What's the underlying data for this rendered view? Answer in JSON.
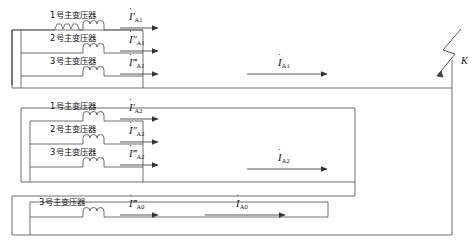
{
  "diagram": {
    "type": "single-line-electrical-network",
    "fault_marker": {
      "label": "K",
      "symbol": "lightning-fault-icon"
    },
    "groups": [
      {
        "id": "group-1",
        "total_current": "I_A1",
        "total_current_base": "I",
        "total_current_sub": "A1",
        "total_current_primes": "",
        "branches": [
          {
            "name": "1号主变压器",
            "current_base": "I",
            "current_primes": "′",
            "current_sub": "A1"
          },
          {
            "name": "2号主变压器",
            "current_base": "I",
            "current_primes": "″",
            "current_sub": "A1"
          },
          {
            "name": "3号主变压器",
            "current_base": "I",
            "current_primes": "‴",
            "current_sub": "A1"
          }
        ]
      },
      {
        "id": "group-2",
        "total_current": "I_A2",
        "total_current_base": "I",
        "total_current_sub": "A2",
        "total_current_primes": "",
        "branches": [
          {
            "name": "1号主变压器",
            "current_base": "I",
            "current_primes": "′",
            "current_sub": "A2"
          },
          {
            "name": "2号主变压器",
            "current_base": "I",
            "current_primes": "″",
            "current_sub": "A2"
          },
          {
            "name": "3号主变压器",
            "current_base": "I",
            "current_primes": "‴",
            "current_sub": "A2"
          }
        ]
      },
      {
        "id": "group-0",
        "total_current": "I_A0",
        "total_current_base": "I",
        "total_current_sub": "A0",
        "total_current_primes": "",
        "branches": [
          {
            "name": "3号主变压器",
            "current_base": "I",
            "current_primes": "‴",
            "current_sub": "A0"
          }
        ]
      }
    ],
    "colors": {
      "line": "#555555",
      "text": "#111111",
      "background": "#ffffff"
    }
  }
}
